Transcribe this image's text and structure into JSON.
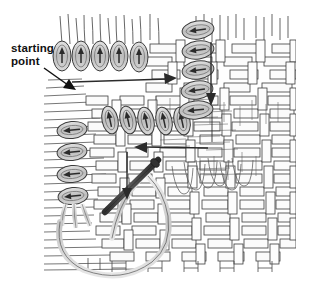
{
  "figure": {
    "type": "technical-line-illustration",
    "background_color": "#ffffff",
    "ink_color": "#2b2b2b",
    "shade_color": "#c9c9c9",
    "needle_color": "#3a3a3a",
    "canvas": {
      "width": 313,
      "height": 293
    }
  },
  "annotations": {
    "starting_point": {
      "label_line1": "starting",
      "label_line2": "point",
      "leader_arrow": "diagonal-arrow-down-right"
    }
  },
  "legend_symbols": {
    "stitch_oval": "oval loop marker",
    "direction_arrow_up": "arrow pointing up",
    "direction_arrow_left": "arrow pointing left",
    "direction_arrow_down": "arrow pointing down",
    "direction_arrow_right": "arrow pointing right"
  },
  "diagram_elements": {
    "top_stitch_row": {
      "name": "top row of vertical stitch ovals",
      "count": 5,
      "arrow_direction": "up"
    },
    "middle_stitch_row": {
      "name": "middle row of tilted stitch ovals",
      "count": 5,
      "arrow_direction": "up"
    },
    "right_stitch_column": {
      "name": "right column of horizontal stitch ovals",
      "count": 5,
      "arrow_direction": "left"
    },
    "left_stitch_column": {
      "name": "left column of horizontal stitch ovals",
      "count": 4,
      "arrow_direction": "left"
    },
    "travel_arrow_right": {
      "name": "horizontal travel arrow near starting point",
      "direction": "right"
    },
    "travel_arrow_down_right": {
      "name": "vertical travel arrow on right side",
      "direction": "down"
    },
    "travel_arrow_down_middle": {
      "name": "vertical travel arrow in middle",
      "direction": "down"
    },
    "travel_arrow_left": {
      "name": "horizontal travel arrow at needle row",
      "direction": "left"
    },
    "needle": {
      "name": "threading needle",
      "orientation": "diagonal up-right"
    },
    "thread_loop": {
      "name": "large working thread loop",
      "shape": "open curve"
    },
    "weave_ground": {
      "name": "plaited weave background",
      "pattern": "over-under basket weave"
    }
  }
}
